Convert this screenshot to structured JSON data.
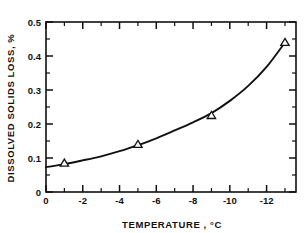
{
  "chart_data": {
    "type": "line",
    "title": "",
    "subtitle": "",
    "xlabel": "TEMPERATURE , °C",
    "ylabel": "DISSOLVED SOLIDS LOSS, %",
    "xlim": [
      0,
      -13.6
    ],
    "ylim": [
      0,
      0.5
    ],
    "x_tick_labels": [
      "0",
      "-2",
      "-4",
      "-6",
      "-8",
      "-10",
      "-12"
    ],
    "x_tick_values": [
      0,
      -2,
      -4,
      -6,
      -8,
      -10,
      -12
    ],
    "x_minor_step": 1,
    "y_tick_labels": [
      "0",
      "0.1",
      "0.2",
      "0.3",
      "0.4",
      "0.5"
    ],
    "y_tick_values": [
      0,
      0.1,
      0.2,
      0.3,
      0.4,
      0.5
    ],
    "y_minor_step": 0.05,
    "grid": false,
    "legend": null,
    "marker_shape": "triangle-up",
    "series": [
      {
        "name": "Dissolved solids loss",
        "x": [
          -1.0,
          -5.0,
          -9.0,
          -13.0
        ],
        "values": [
          0.085,
          0.14,
          0.225,
          0.44
        ]
      }
    ],
    "fit_curve": {
      "name": "fitted curve",
      "x": [
        0.0,
        -1.0,
        -2.0,
        -3.0,
        -4.0,
        -5.0,
        -6.0,
        -7.0,
        -8.0,
        -9.0,
        -10.0,
        -11.0,
        -12.0,
        -13.0
      ],
      "values": [
        0.073,
        0.082,
        0.093,
        0.105,
        0.12,
        0.138,
        0.158,
        0.181,
        0.205,
        0.232,
        0.268,
        0.312,
        0.368,
        0.44
      ]
    },
    "colors": {
      "axis": "#111111",
      "curve": "#111111",
      "marker_face": "#ffffff",
      "marker_edge": "#111111",
      "background": "#ffffff"
    }
  }
}
